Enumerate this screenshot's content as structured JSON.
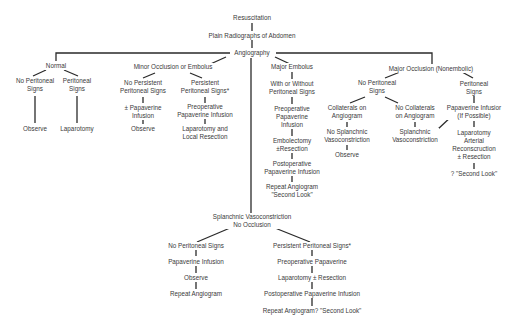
{
  "diagram": {
    "root": {
      "resuscitation": "Resuscitation",
      "plain_radiographs": "Plain Radiographs of Abdomen",
      "angiography": "Angiography"
    },
    "normal": {
      "label": "Normal",
      "no_peritoneal": [
        "No Peritoneal",
        "Signs"
      ],
      "peritoneal": [
        "Peritoneal",
        "Signs"
      ],
      "observe": "Observe",
      "laparotomy": "Laparotomy"
    },
    "minor": {
      "label": "Minor Occlusion or Embolus",
      "no_persistent": [
        "No Persistent",
        "Peritoneal Signs"
      ],
      "papaverine": [
        "± Papaverine",
        "Infusion"
      ],
      "observe": "Observe",
      "persistent": [
        "Persistent",
        "Peritoneal Signs*"
      ],
      "preop": [
        "Preoperative",
        "Papaverine Infusion"
      ],
      "laparotomy": [
        "Laparotomy  and",
        "Local Resection"
      ]
    },
    "major_embolus": {
      "label": "Major Embolus",
      "with_without": [
        "With or Without",
        "Peritoneal Signs"
      ],
      "preop": [
        "Preoperative",
        "Papaverine",
        "Infusion"
      ],
      "embolectomy": [
        "Embolectomy",
        "±Resection"
      ],
      "postop": [
        "Postoperative",
        "Papaverine Infusion"
      ],
      "repeat": [
        "Repeat Angiogram",
        "\"Second Look\""
      ]
    },
    "major_occlusion": {
      "label": "Major Occlusion (Nonembolic)",
      "no_peritoneal": [
        "No Peritoneal",
        "Signs"
      ],
      "collaterals": [
        "Collaterals on",
        "Angiogram"
      ],
      "no_splanchnic": [
        "No Splanchnic",
        "Vasoconstriction"
      ],
      "observe": "Observe",
      "no_collaterals": [
        "No Collaterals",
        "on Angiogram"
      ],
      "splanchnic": [
        "Splanchnic",
        "Vasoconstriction"
      ],
      "peritoneal": [
        "Peritoneal",
        "Signs"
      ],
      "papaverine": [
        "Papaverine Infusior",
        "(If Possible)"
      ],
      "laparotomy": [
        "Laparotomy",
        "Arterial",
        "Reconscruction",
        "± Resection"
      ],
      "second_look": "? \"Second Look\""
    },
    "vasoconstriction": {
      "label": [
        "Splanchnic Vasoconstriction",
        "No Occlusion"
      ],
      "no_peritoneal": "No Peritoneal Signs",
      "papaverine": "Papaverine Infusion",
      "observe": "Observe",
      "repeat": "Repeat Angiogram",
      "persistent": "Persistent Peritoneal Signs*",
      "preop": "Preoperative Papaverine",
      "laparotomy": "Laparotomy ± Resection",
      "postop": "Postoperative Papaverine Infusion",
      "repeat_second": "Repeat Angiogram? \"Second Look\""
    }
  }
}
